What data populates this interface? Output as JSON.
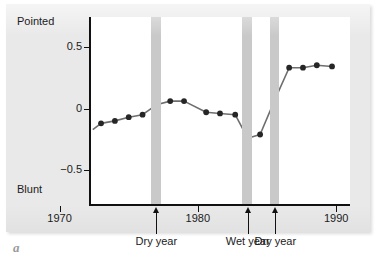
{
  "figure": {
    "caption_letter": "a"
  },
  "axes": {
    "y_top_label": "Pointed",
    "y_bottom_label": "Blunt",
    "y_ticks": [
      {
        "value": 0.5,
        "label": "0.5"
      },
      {
        "value": 0.0,
        "label": "0"
      },
      {
        "value": -0.5,
        "label": "−0.5"
      }
    ],
    "x_ticks": [
      {
        "value": 1970,
        "label": "1970"
      },
      {
        "value": 1980,
        "label": "1980"
      },
      {
        "value": 1990,
        "label": "1990"
      }
    ]
  },
  "annotations": [
    {
      "name": "dry-year-1977",
      "label": "Dry year",
      "year": 1977.0
    },
    {
      "name": "wet-year-1983",
      "label": "Wet year",
      "year": 1983.6
    },
    {
      "name": "dry-year-1985",
      "label": "Dry year",
      "year": 1985.6
    }
  ],
  "event_bands": [
    {
      "name": "dry-year-band-1977",
      "start": 1976.6,
      "end": 1977.3,
      "color": "#c9c9c9"
    },
    {
      "name": "wet-year-band-1983",
      "start": 1983.2,
      "end": 1983.9,
      "color": "#c9c9c9"
    },
    {
      "name": "dry-year-band-1985",
      "start": 1985.2,
      "end": 1985.9,
      "color": "#c9c9c9"
    }
  ],
  "style": {
    "page_background": "#e9e9e9",
    "plot_background": "#ffffff",
    "axis_color": "#111111",
    "line_color": "#6e6e6e",
    "marker_color": "#262626",
    "band_color": "#c9c9c9"
  },
  "chart_data": {
    "type": "line",
    "title": "",
    "subtitle": "",
    "xlabel": "",
    "ylabel": "",
    "ylabel_top": "Pointed",
    "ylabel_bottom": "Blunt",
    "xlim": [
      1972.2,
      1991.0
    ],
    "ylim": [
      -0.78,
      0.74
    ],
    "grid": false,
    "legend": null,
    "x": [
      1973.0,
      1974.0,
      1975.0,
      1976.0,
      1977.0,
      1978.0,
      1979.0,
      1980.0,
      1981.0,
      1982.0,
      1983.0,
      1984.0,
      1985.0,
      1986.0,
      1987.0,
      1988.0,
      1989.0,
      1990.0
    ],
    "y": [
      -0.12,
      -0.1,
      -0.07,
      -0.05,
      0.03,
      0.06,
      0.06,
      -0.03,
      -0.04,
      -0.05,
      -0.24,
      -0.21,
      0.08,
      0.33,
      0.33,
      0.35,
      0.34,
      null
    ],
    "series": [
      {
        "name": "Beak shape index",
        "points": [
          {
            "x": 1973.0,
            "y": -0.12
          },
          {
            "x": 1974.0,
            "y": -0.1
          },
          {
            "x": 1975.0,
            "y": -0.07
          },
          {
            "x": 1976.0,
            "y": -0.05
          },
          {
            "x": 1977.0,
            "y": 0.03
          },
          {
            "x": 1978.0,
            "y": 0.06
          },
          {
            "x": 1979.0,
            "y": 0.06
          },
          {
            "x": 1980.6,
            "y": -0.03
          },
          {
            "x": 1981.6,
            "y": -0.04
          },
          {
            "x": 1982.7,
            "y": -0.05
          },
          {
            "x": 1983.6,
            "y": -0.24
          },
          {
            "x": 1984.5,
            "y": -0.21
          },
          {
            "x": 1985.6,
            "y": 0.08
          },
          {
            "x": 1986.6,
            "y": 0.33
          },
          {
            "x": 1987.6,
            "y": 0.33
          },
          {
            "x": 1988.6,
            "y": 0.35
          },
          {
            "x": 1989.7,
            "y": 0.34
          }
        ]
      }
    ],
    "leader_segment": {
      "x_start": 1972.4,
      "y_start": -0.17
    }
  }
}
